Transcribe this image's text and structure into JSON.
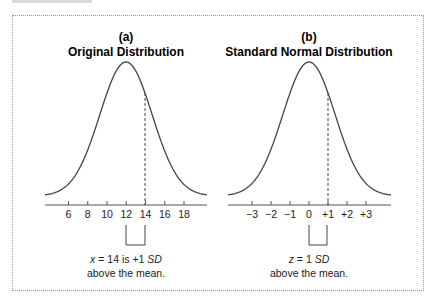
{
  "panels": [
    {
      "letter": "(a)",
      "title": "Original Distribution",
      "tick_labels": [
        "6",
        "8",
        "10",
        "12",
        "14",
        "16",
        "18"
      ],
      "marked_value": "14",
      "mean_value": "12",
      "caption_line1_var": "x",
      "caption_line1_rest": " = 14 is +1 ",
      "caption_line1_unit": "SD",
      "caption_line2": "above the mean."
    },
    {
      "letter": "(b)",
      "title": "Standard Normal Distribution",
      "tick_labels": [
        "−3",
        "−2",
        "−1",
        "0",
        "+1",
        "+2",
        "+3"
      ],
      "marked_value": "+1",
      "mean_value": "0",
      "caption_line1_var": "z",
      "caption_line1_rest": " = 1 ",
      "caption_line1_unit": "SD",
      "caption_line2": "above the mean."
    }
  ],
  "colors": {
    "curve": "#444444",
    "axis": "#555555",
    "border": "#9a9a9a"
  }
}
